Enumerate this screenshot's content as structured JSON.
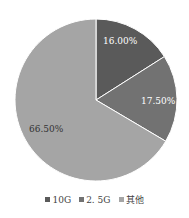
{
  "chart_data": {
    "type": "pie",
    "title": "",
    "categories": [
      "10G",
      "2.5G",
      "其他"
    ],
    "values": [
      16.0,
      17.5,
      66.5
    ],
    "labels": [
      "16.00%",
      "17.50%",
      "66.50%"
    ],
    "colors": [
      "#5a5a5a",
      "#727272",
      "#a5a5a5"
    ],
    "legend_position": "bottom",
    "start_angle_deg": 0,
    "direction": "clockwise"
  },
  "legend": {
    "items": [
      {
        "label": "10G",
        "color": "#5a5a5a"
      },
      {
        "label": "2. 5G",
        "color": "#727272"
      },
      {
        "label": "其他",
        "color": "#a5a5a5"
      }
    ]
  }
}
